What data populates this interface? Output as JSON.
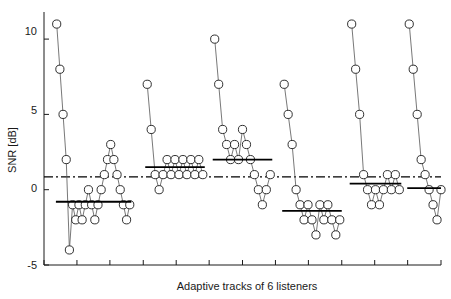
{
  "chart_data": {
    "type": "line",
    "title": "",
    "xlabel": "Adaptive tracks of 6 listeners",
    "ylabel": "SNR [dB]",
    "ylim": [
      -5,
      11.8
    ],
    "yticks": [
      -5,
      0,
      5,
      10
    ],
    "ytick_labels": [
      "-5",
      "0",
      "5",
      "10"
    ],
    "xlim": [
      0,
      100
    ],
    "xticks": [
      0,
      8.3,
      16.6,
      25,
      33.3,
      41.6,
      50,
      58.3,
      66.6,
      75,
      83.3,
      91.6,
      100
    ],
    "xtick_labels": [
      "",
      "",
      "",
      "",
      "",
      "",
      "",
      "",
      "",
      "",
      "",
      "",
      ""
    ],
    "grid": false,
    "legend": null,
    "marker": "open-circle",
    "reference_line": {
      "label": "overall mean SNR",
      "style": "dash-dot",
      "value": 0.85
    },
    "series": [
      {
        "name": "Listener 1",
        "mean_line": {
          "value": -0.8,
          "x_start": 3.0,
          "x_end": 22.0
        },
        "x": [
          3.2,
          4.0,
          4.8,
          5.6,
          6.4,
          7.2,
          8.0,
          8.8,
          9.6,
          10.4,
          11.2,
          12.0,
          12.8,
          13.6,
          14.4,
          15.2,
          16.0,
          16.8,
          17.6,
          18.4,
          19.2,
          20.0,
          20.8,
          21.6
        ],
        "y": [
          11.0,
          8.0,
          5.0,
          2.0,
          -4.0,
          -1.0,
          -2.0,
          -1.0,
          -2.0,
          -1.0,
          0.0,
          -1.0,
          -2.0,
          -1.0,
          0.0,
          1.0,
          2.0,
          3.0,
          2.0,
          1.0,
          0.0,
          -1.0,
          -2.0,
          -1.0
        ]
      },
      {
        "name": "Listener 2",
        "mean_line": {
          "value": 1.5,
          "x_start": 25.5,
          "x_end": 40.5
        },
        "x": [
          26.0,
          27.0,
          28.0,
          29.0,
          30.0,
          31.0,
          32.0,
          33.0,
          34.0,
          35.0,
          36.0,
          37.0,
          38.0,
          39.0,
          40.0
        ],
        "y": [
          7.0,
          4.0,
          1.0,
          0.0,
          1.0,
          2.0,
          1.0,
          2.0,
          1.0,
          2.0,
          1.0,
          2.0,
          1.0,
          2.0,
          1.0
        ]
      },
      {
        "name": "Listener 3",
        "mean_line": {
          "value": 2.0,
          "x_start": 42.5,
          "x_end": 57.5
        },
        "x": [
          43.0,
          44.0,
          45.0,
          46.0,
          47.0,
          48.0,
          49.0,
          50.0,
          51.0,
          52.0,
          53.0,
          54.0,
          55.0,
          56.0,
          57.0
        ],
        "y": [
          10.0,
          7.0,
          4.0,
          3.0,
          2.0,
          3.0,
          2.0,
          4.0,
          3.0,
          2.0,
          1.0,
          0.0,
          -1.0,
          0.0,
          1.0
        ]
      },
      {
        "name": "Listener 4",
        "mean_line": {
          "value": -1.4,
          "x_start": 60.0,
          "x_end": 75.0
        },
        "x": [
          60.5,
          61.5,
          62.5,
          63.5,
          64.5,
          65.5,
          66.5,
          67.5,
          68.5,
          69.5,
          70.5,
          71.5,
          72.5,
          73.5,
          74.5
        ],
        "y": [
          7.0,
          5.0,
          3.0,
          0.0,
          -1.0,
          -2.0,
          -1.0,
          -2.0,
          -3.0,
          -1.0,
          -2.0,
          -1.0,
          -2.0,
          -3.0,
          -2.0
        ]
      },
      {
        "name": "Listener 5",
        "mean_line": {
          "value": 0.4,
          "x_start": 77.0,
          "x_end": 90.0
        },
        "x": [
          77.5,
          78.5,
          79.5,
          80.5,
          81.5,
          82.5,
          83.5,
          84.5,
          85.5,
          86.5,
          87.5,
          88.5,
          89.5
        ],
        "y": [
          11.0,
          8.0,
          5.0,
          1.0,
          0.0,
          -1.0,
          0.0,
          -1.0,
          0.0,
          1.0,
          0.0,
          1.0,
          0.0
        ]
      },
      {
        "name": "Listener 6",
        "mean_line": {
          "value": 0.1,
          "x_start": 91.5,
          "x_end": 100.0
        },
        "x": [
          92.0,
          93.0,
          94.0,
          95.0,
          96.0,
          97.0,
          98.0,
          99.0,
          100.0
        ],
        "y": [
          11.0,
          8.0,
          5.0,
          2.0,
          1.0,
          0.0,
          -1.0,
          -2.0,
          0.0
        ]
      }
    ]
  },
  "colors": {
    "axis": "#1a1a1a",
    "marker_stroke": "#1a1a1a",
    "line": "#555555",
    "mean_line": "#000000",
    "reference_line": "#000000",
    "background": "#ffffff"
  },
  "axes": {
    "y_title": "SNR [dB]",
    "x_title": "Adaptive tracks of 6 listeners",
    "y_tick_0": "10",
    "y_tick_1": "5",
    "y_tick_2": "0",
    "y_tick_3": "-5"
  }
}
